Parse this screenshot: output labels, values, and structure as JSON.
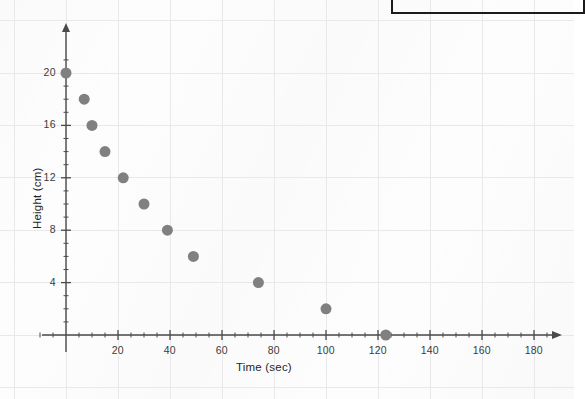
{
  "figure": {
    "kind": "scatter-plot",
    "background_color": "#fdfdfd",
    "grid_color": "#e9e9ec",
    "axis_color": "#4a4a4a",
    "point_color": "#808080",
    "scan_box_color": "#1b1b1b"
  },
  "chart_data": {
    "type": "scatter",
    "title": "",
    "xlabel": "Time (sec)",
    "ylabel": "Height (cm)",
    "xlim": [
      0,
      190
    ],
    "ylim": [
      0,
      21.5
    ],
    "grid": true,
    "legend": null,
    "x_ticks": [
      20,
      40,
      60,
      80,
      100,
      120,
      140,
      160,
      180
    ],
    "x_tick_labels": [
      "20",
      "40",
      "60",
      "80",
      "100",
      "120",
      "140",
      "160",
      "180"
    ],
    "x_minor_tick_step": 5,
    "y_ticks": [
      4,
      8,
      12,
      16,
      20
    ],
    "y_tick_labels": [
      "4",
      "8",
      "12",
      "16",
      "20"
    ],
    "y_minor_tick_step": 1,
    "x": [
      0,
      7,
      10,
      15,
      22,
      30,
      39,
      49,
      74,
      100,
      123
    ],
    "y": [
      20,
      18,
      16,
      14,
      12,
      10,
      8,
      6,
      4,
      2,
      0
    ],
    "points": [
      {
        "x": 0,
        "y": 20
      },
      {
        "x": 7,
        "y": 18
      },
      {
        "x": 10,
        "y": 16
      },
      {
        "x": 15,
        "y": 14
      },
      {
        "x": 22,
        "y": 12
      },
      {
        "x": 30,
        "y": 10
      },
      {
        "x": 39,
        "y": 8
      },
      {
        "x": 49,
        "y": 6
      },
      {
        "x": 74,
        "y": 4
      },
      {
        "x": 100,
        "y": 2
      },
      {
        "x": 123,
        "y": 0
      }
    ],
    "marker_size": 11
  },
  "axes": {
    "x_axis_label": "Time (sec)",
    "y_axis_label": "Height (cm)"
  }
}
